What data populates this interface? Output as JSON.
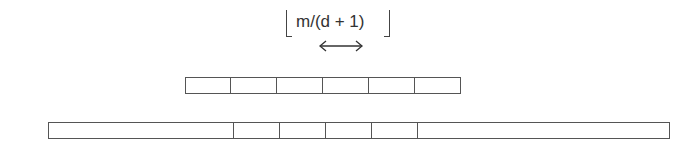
{
  "diagram": {
    "label": "m/(d + 1)",
    "label_notation": "floor",
    "arrow": "double-headed horizontal arrow",
    "top_row": {
      "cell_widths": [
        46,
        46,
        46,
        46,
        46,
        46
      ]
    },
    "bottom_row": {
      "cell_widths": [
        186,
        46,
        46,
        46,
        46,
        252
      ]
    },
    "stroke_color": "#555555"
  }
}
